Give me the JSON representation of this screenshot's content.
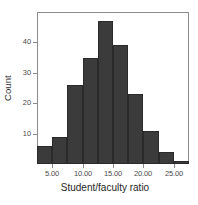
{
  "chart_data": {
    "type": "bar",
    "title": "",
    "subtitle": "",
    "xlabel": "Student/faculty ratio",
    "ylabel": "Count",
    "xlim": [
      2.5,
      27.5
    ],
    "ylim": [
      0,
      50
    ],
    "grid": false,
    "legend": null,
    "bin_width": 2.5,
    "bin_edges": [
      2.5,
      5,
      7.5,
      10,
      12.5,
      15,
      17.5,
      20,
      22.5,
      25,
      27.5
    ],
    "categories": [
      "2.5-5.0",
      "5.0-7.5",
      "7.5-10.0",
      "10.0-12.5",
      "12.5-15.0",
      "15.0-17.5",
      "17.5-20.0",
      "20.0-22.5",
      "22.5-25.0",
      "25.0-27.5"
    ],
    "values": [
      6,
      9,
      26,
      35,
      47,
      39,
      23,
      11,
      4,
      1
    ],
    "x_tick_values": [
      5,
      10,
      15,
      20,
      25
    ],
    "x_tick_labels": [
      "5.00",
      "10.00",
      "15.00",
      "20.00",
      "25.00"
    ],
    "y_tick_values": [
      10,
      20,
      30,
      40
    ],
    "y_tick_labels": [
      "10",
      "20",
      "30",
      "40"
    ],
    "bar_color": "#3b3b3b",
    "bar_border_color": "#2a2a2a",
    "frame_color": "#8c8c8c",
    "background_color": "#ffffff"
  },
  "axes": {
    "y_title": "Count",
    "x_title": "Student/faculty ratio"
  }
}
